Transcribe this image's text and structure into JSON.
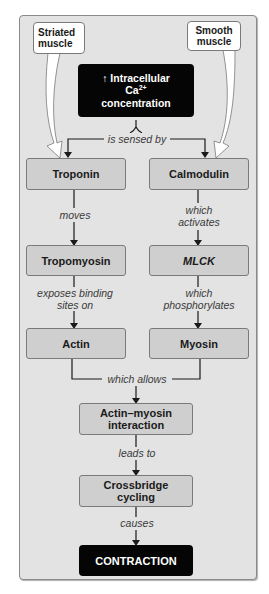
{
  "diagram": {
    "sources": {
      "striated": "Striated muscle",
      "smooth": "Smooth muscle"
    },
    "trigger": {
      "arrow": "↑",
      "line1": "Intracellular",
      "line2": "Ca",
      "line2_sup": "2+",
      "line3": "concentration"
    },
    "edges": {
      "sensed": "is sensed by",
      "moves": "moves",
      "which_activates_1": "which",
      "which_activates_2": "activates",
      "exposes_1": "exposes binding",
      "exposes_2": "sites on",
      "phos_1": "which",
      "phos_2": "phosphorylates",
      "allows": "which allows",
      "leads": "leads to",
      "causes": "causes"
    },
    "nodes": {
      "troponin": "Troponin",
      "calmodulin": "Calmodulin",
      "tropomyosin": "Tropomyosin",
      "mlck": "MLCK",
      "actin": "Actin",
      "myosin": "Myosin",
      "interaction_1": "Actin–myosin",
      "interaction_2": "interaction",
      "cycling_1": "Crossbridge",
      "cycling_2": "cycling",
      "contraction": "CONTRACTION"
    },
    "colors": {
      "panel": "#e3e3e3",
      "box_gray": "#cfcfcf",
      "box_black": "#050505",
      "line": "#1a1a1a"
    }
  }
}
